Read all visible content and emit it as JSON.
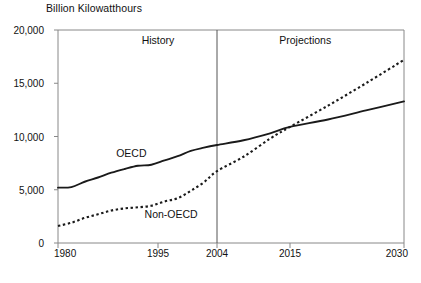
{
  "chart_data": {
    "type": "line",
    "title": "",
    "ylabel": "Billion Kilowatthours",
    "xlabel": "",
    "xlim": [
      1980,
      2030
    ],
    "ylim": [
      0,
      20000
    ],
    "grid": false,
    "legend_position": "inline-annotations",
    "y_ticks": [
      0,
      5000,
      10000,
      15000,
      20000
    ],
    "y_tick_labels": [
      "0",
      "5,000",
      "10,000",
      "15,000",
      "20,000"
    ],
    "x_ticks": [
      1980,
      1995,
      2004,
      2015,
      2030
    ],
    "x_tick_labels": [
      "1980",
      "1995",
      "2004",
      "2015",
      "2030"
    ],
    "annotations": [
      {
        "text": "History",
        "x": 1995,
        "y": 19000
      },
      {
        "text": "Projections",
        "x": 2017,
        "y": 19000
      },
      {
        "text": "OECD",
        "x": 1991,
        "y": 8400
      },
      {
        "text": "Non-OECD",
        "x": 1997,
        "y": 2600
      }
    ],
    "divider": {
      "x": 2004,
      "label": "history-projection-divider"
    },
    "series": [
      {
        "name": "OECD",
        "style": "solid",
        "color": "#1a1a1a",
        "x": [
          1980,
          1982,
          1984,
          1986,
          1988,
          1990,
          1992,
          1994,
          1996,
          1998,
          2000,
          2002,
          2004,
          2008,
          2012,
          2015,
          2020,
          2025,
          2030
        ],
        "values": [
          5200,
          5250,
          5750,
          6150,
          6600,
          6950,
          7250,
          7350,
          7750,
          8150,
          8650,
          8950,
          9200,
          9650,
          10300,
          10900,
          11600,
          12450,
          13300
        ]
      },
      {
        "name": "Non-OECD",
        "style": "dotted",
        "color": "#1a1a1a",
        "x": [
          1980,
          1982,
          1984,
          1986,
          1988,
          1990,
          1992,
          1994,
          1996,
          1998,
          2000,
          2002,
          2004,
          2008,
          2012,
          2015,
          2020,
          2025,
          2030
        ],
        "values": [
          1600,
          1900,
          2350,
          2700,
          3050,
          3250,
          3350,
          3500,
          3900,
          4200,
          4900,
          5700,
          6750,
          8100,
          9800,
          10900,
          12900,
          15000,
          17200
        ]
      }
    ]
  }
}
